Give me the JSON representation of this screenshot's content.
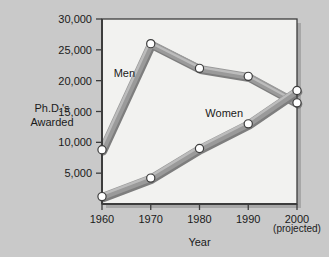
{
  "chart_data": {
    "type": "line",
    "title": "",
    "xlabel": "Year",
    "ylabel": "Ph.D.'s Awarded",
    "ylabel_line1": "Ph.D.'s",
    "ylabel_line2": "Awarded",
    "x": [
      1960,
      1970,
      1980,
      1990,
      2000
    ],
    "categories": [
      "1960",
      "1970",
      "1980",
      "1990",
      "2000"
    ],
    "xlim": [
      1960,
      2000
    ],
    "ylim": [
      0,
      30000
    ],
    "yticks": [
      5000,
      10000,
      15000,
      20000,
      25000,
      30000
    ],
    "ytick_labels": [
      "5,000",
      "10,000",
      "15,000",
      "20,000",
      "25,000",
      "30,000"
    ],
    "grid": false,
    "legend": "inline-annotations",
    "annotations": [
      {
        "text": "Men",
        "x": 1962.4,
        "y": 20600
      },
      {
        "text": "Women",
        "x": 1981.2,
        "y": 14100
      },
      {
        "text": "(projected)",
        "x": 2000,
        "y": -4600
      }
    ],
    "series": [
      {
        "name": "Men",
        "color": "#9a9a9a",
        "values": [
          8800,
          26000,
          22000,
          20700,
          16400
        ]
      },
      {
        "name": "Women",
        "color": "#9a9a9a",
        "values": [
          1200,
          4200,
          9000,
          13000,
          18400
        ]
      }
    ]
  },
  "style": {
    "page_background": "#c9c9c9",
    "plot_background": "#f2f2f0",
    "frame_color": "#3d3d3d",
    "shadow_color": "#8a8a8a",
    "line_color": "#9a9a9a",
    "line_highlight": "#c2c2c2",
    "marker_fill": "#ffffff",
    "marker_stroke": "#3d3d3d",
    "text_color": "#1a1a1a"
  }
}
